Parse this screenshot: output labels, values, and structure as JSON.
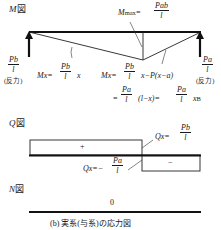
{
  "moment_diagram": {
    "title": "M図",
    "title_var": "M",
    "title_suffix": "図",
    "mmax_label": "Mmax",
    "mmax_var": "M",
    "mmax_sub": "max",
    "mmax_eq": "=",
    "mmax_num": "Pab",
    "mmax_den": "l",
    "left_reaction_num": "Pb",
    "left_reaction_den": "l",
    "left_reaction_note": "(反力)",
    "right_reaction_num": "Pa",
    "right_reaction_den": "l",
    "right_reaction_note": "(反力)",
    "left_eq_lhs": "Mx=",
    "left_eq_num": "Pb",
    "left_eq_den": "l",
    "left_eq_tail": "x",
    "right_eq_lhs": "Mx=",
    "right_eq_num": "Pb",
    "right_eq_den": "l",
    "right_eq_tail": "x−P(x−a)",
    "right_eq2_lead": "=",
    "right_eq2_num": "Pa",
    "right_eq2_den": "l",
    "right_eq2_mid": "(l−x)=",
    "right_eq2_num2": "Pa",
    "right_eq2_den2": "l",
    "right_eq2_tail": "x",
    "right_eq2_sub": "B"
  },
  "shear_diagram": {
    "title": "Q図",
    "title_var": "Q",
    "title_suffix": "図",
    "positive_sign": "+",
    "negative_sign": "−",
    "pos_eq_lhs": "Qx=",
    "pos_eq_num": "Pb",
    "pos_eq_den": "l",
    "neg_eq_lhs": "Qx=−",
    "neg_eq_num": "Pa",
    "neg_eq_den": "l"
  },
  "axial_diagram": {
    "title": "N図",
    "title_var": "N",
    "title_suffix": "図",
    "value": "0"
  },
  "caption": "(b) 実系(与系)の応力図"
}
